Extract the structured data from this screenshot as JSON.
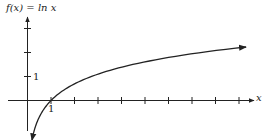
{
  "chart_data": {
    "type": "line",
    "title": "f(x) = ln x",
    "xlabel": "x",
    "ylabel": "",
    "function": "ln x",
    "series": [
      {
        "name": "f(x) = ln x",
        "x": [
          0.1,
          0.25,
          0.5,
          0.75,
          1,
          1.5,
          2,
          3,
          4,
          5,
          6,
          7,
          8,
          9.3
        ],
        "values": [
          -2.303,
          -1.386,
          -0.693,
          -0.288,
          0,
          0.405,
          0.693,
          1.099,
          1.386,
          1.609,
          1.792,
          1.946,
          2.079,
          2.23
        ]
      }
    ],
    "x_ticks": [
      1,
      2,
      3,
      4,
      5,
      6,
      7,
      8,
      9
    ],
    "x_tick_labels": [
      "1"
    ],
    "y_ticks": [
      1,
      2,
      3
    ],
    "y_tick_labels": [
      "1"
    ],
    "xlim": [
      0,
      9.7
    ],
    "ylim": [
      -1.2,
      3.5
    ],
    "grid": false,
    "legend": "none",
    "annotations": [
      "curve passes through (1, 0)",
      "arrowheads on both ends of curve"
    ]
  },
  "labels": {
    "title": "f(x) = ln x",
    "x_axis": "x",
    "x_one": "1",
    "y_one": "1"
  },
  "colors": {
    "ink": "#222222",
    "background": "#ffffff"
  }
}
